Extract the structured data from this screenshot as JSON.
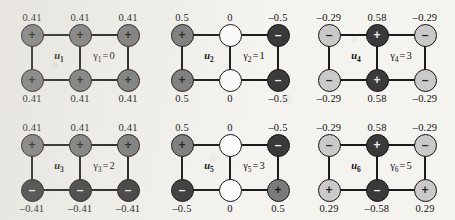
{
  "figure": {
    "background_color": "#f5f3ef",
    "node_colors": {
      "mid": "#7b7b7b",
      "dark": "#3a3a3a",
      "light": "#c9c9c9",
      "white": "#fdfcfa"
    },
    "grid": {
      "columns": 3,
      "rows": 2,
      "node_columns": 3,
      "node_rows": 2
    }
  },
  "chart_data": {
    "type": "diagram",
    "title": "",
    "panels": [
      {
        "id": "panel-1",
        "vector_label": "u",
        "vector_sub": "1",
        "eigen_label": "γ",
        "eigen_sub": "1",
        "eigen_text": "γ₁=0",
        "eigen_value": "0",
        "top_values": [
          "0.41",
          "0.41",
          "0.41"
        ],
        "bottom_values": [
          "0.41",
          "0.41",
          "0.41"
        ],
        "top_signs": [
          "+",
          "+",
          "+"
        ],
        "bottom_signs": [
          "+",
          "+",
          "+"
        ],
        "top_shades": [
          "mid",
          "mid",
          "mid"
        ],
        "bottom_shades": [
          "mid",
          "mid",
          "mid"
        ]
      },
      {
        "id": "panel-2",
        "vector_label": "u",
        "vector_sub": "2",
        "eigen_label": "γ",
        "eigen_sub": "2",
        "eigen_text": "γ₂=1",
        "eigen_value": "1",
        "top_values": [
          "0.5",
          "0",
          "–0.5"
        ],
        "bottom_values": [
          "0.5",
          "0",
          "–0.5"
        ],
        "top_signs": [
          "+",
          "",
          "–"
        ],
        "bottom_signs": [
          "+",
          "",
          "–"
        ],
        "top_shades": [
          "mid",
          "white",
          "dark"
        ],
        "bottom_shades": [
          "mid",
          "white",
          "dark"
        ]
      },
      {
        "id": "panel-3",
        "vector_label": "u",
        "vector_sub": "4",
        "eigen_label": "γ",
        "eigen_sub": "4",
        "eigen_text": "γ₄=3",
        "eigen_value": "3",
        "top_values": [
          "–0.29",
          "0.58",
          "–0.29"
        ],
        "bottom_values": [
          "–0.29",
          "0.58",
          "–0.29"
        ],
        "top_signs": [
          "–",
          "+",
          "–"
        ],
        "bottom_signs": [
          "–",
          "+",
          "–"
        ],
        "top_shades": [
          "light",
          "dark",
          "light"
        ],
        "bottom_shades": [
          "light",
          "dark",
          "light"
        ]
      },
      {
        "id": "panel-4",
        "vector_label": "u",
        "vector_sub": "3",
        "eigen_label": "γ",
        "eigen_sub": "3",
        "eigen_text": "γ₃=2",
        "eigen_value": "2",
        "top_values": [
          "0.41",
          "0.41",
          "0.41"
        ],
        "bottom_values": [
          "–0.41",
          "–0.41",
          "–0.41"
        ],
        "top_signs": [
          "+",
          "+",
          "+"
        ],
        "bottom_signs": [
          "–",
          "–",
          "–"
        ],
        "top_shades": [
          "mid",
          "mid",
          "mid"
        ],
        "bottom_shades": [
          "dark",
          "dark",
          "dark"
        ]
      },
      {
        "id": "panel-5",
        "vector_label": "u",
        "vector_sub": "5",
        "eigen_label": "γ",
        "eigen_sub": "5",
        "eigen_text": "γ₅=3",
        "eigen_value": "3",
        "top_values": [
          "0.5",
          "0",
          "–0.5"
        ],
        "bottom_values": [
          "–0.5",
          "0",
          "0.5"
        ],
        "top_signs": [
          "+",
          "",
          "–"
        ],
        "bottom_signs": [
          "–",
          "",
          "+"
        ],
        "top_shades": [
          "mid",
          "white",
          "dark"
        ],
        "bottom_shades": [
          "dark",
          "white",
          "mid"
        ]
      },
      {
        "id": "panel-6",
        "vector_label": "u",
        "vector_sub": "6",
        "eigen_label": "γ",
        "eigen_sub": "6",
        "eigen_text": "γ₆=5",
        "eigen_value": "5",
        "top_values": [
          "–0.29",
          "0.58",
          "–0.29"
        ],
        "bottom_values": [
          "0.29",
          "–0.58",
          "0.29"
        ],
        "top_signs": [
          "–",
          "+",
          "–"
        ],
        "bottom_signs": [
          "+",
          "–",
          "+"
        ],
        "top_shades": [
          "light",
          "dark",
          "light"
        ],
        "bottom_shades": [
          "light",
          "dark",
          "light"
        ]
      }
    ]
  }
}
